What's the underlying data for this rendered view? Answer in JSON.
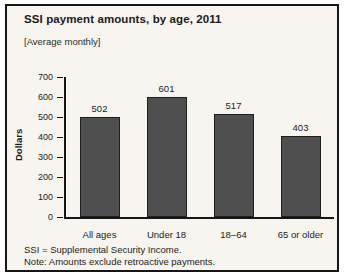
{
  "title": "SSI payment amounts, by age, 2011",
  "subtitle": "[Average monthly]",
  "footnotes": [
    "SSI = Supplemental Security Income.",
    "Note: Amounts exclude retroactive payments."
  ],
  "colors": {
    "bar": "#4f4f4f",
    "bar_border": "#1f1f1f",
    "panel_background": "#f8f5f0",
    "frame_border": "#151515",
    "text": "#1a1a1a"
  },
  "chart_data": {
    "type": "bar",
    "categories": [
      "All ages",
      "Under 18",
      "18–64",
      "65 or older"
    ],
    "values": [
      502,
      601,
      517,
      403
    ],
    "title": "SSI payment amounts, by age, 2011",
    "subtitle": "[Average monthly]",
    "xlabel": "",
    "ylabel": "Dollars",
    "ylim": [
      0,
      700
    ],
    "yticks": [
      0,
      100,
      200,
      300,
      400,
      500,
      600,
      700
    ],
    "grid": false,
    "legend": false,
    "data_labels": true
  }
}
